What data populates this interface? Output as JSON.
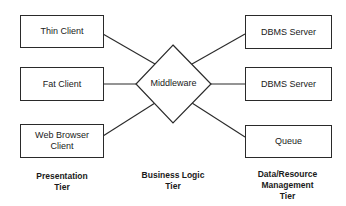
{
  "diagram": {
    "type": "three-tier architecture",
    "presentation_tier": {
      "label": "Presentation\nTier",
      "nodes": [
        {
          "id": "thin-client",
          "label": "Thin Client"
        },
        {
          "id": "fat-client",
          "label": "Fat Client"
        },
        {
          "id": "web-browser-client",
          "label": "Web Browser\nClient"
        }
      ]
    },
    "business_logic_tier": {
      "label": "Business Logic\nTier",
      "middleware": {
        "id": "middleware",
        "label": "Middleware",
        "shape": "diamond"
      }
    },
    "data_tier": {
      "label": "Data/Resource\nManagement\nTier",
      "nodes": [
        {
          "id": "dbms-server-1",
          "label": "DBMS Server"
        },
        {
          "id": "dbms-server-2",
          "label": "DBMS Server"
        },
        {
          "id": "queue",
          "label": "Queue"
        }
      ]
    },
    "edges": [
      {
        "from": "thin-client",
        "to": "middleware"
      },
      {
        "from": "fat-client",
        "to": "middleware"
      },
      {
        "from": "web-browser-client",
        "to": "middleware"
      },
      {
        "from": "middleware",
        "to": "dbms-server-1"
      },
      {
        "from": "middleware",
        "to": "dbms-server-2"
      },
      {
        "from": "middleware",
        "to": "queue"
      }
    ],
    "colors": {
      "stroke": "#2a2a2a",
      "background": "#ffffff",
      "text": "#1a1a1a"
    }
  }
}
